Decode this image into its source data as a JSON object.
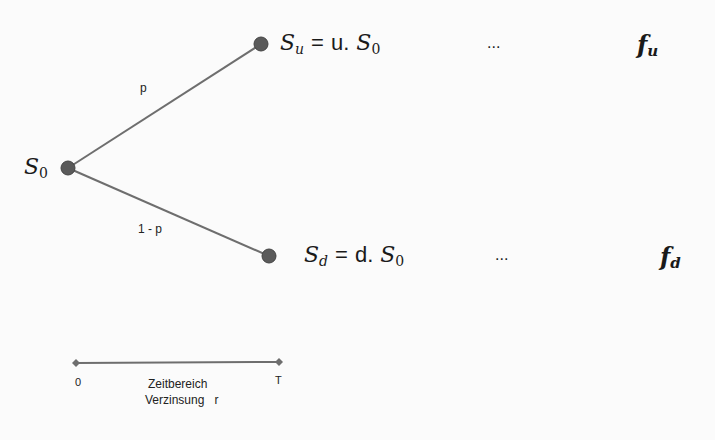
{
  "diagram": {
    "type": "binomial-tree",
    "root": {
      "label_base": "S",
      "label_sub": "0"
    },
    "up_branch": {
      "probability": "p",
      "node": {
        "label_base": "S",
        "label_sub": "u",
        "eq": "=",
        "factor": "u.",
        "rhs_base": "S",
        "rhs_sub": "0"
      },
      "ellipsis": "...",
      "payoff": {
        "base": "f",
        "sub": "u"
      }
    },
    "down_branch": {
      "probability": "1 - p",
      "node": {
        "label_base": "S",
        "label_sub": "d",
        "eq": "=",
        "factor": "d.",
        "rhs_base": "S",
        "rhs_sub": "0"
      },
      "ellipsis": "...",
      "payoff": {
        "base": "f",
        "sub": "d"
      }
    },
    "timeline": {
      "start": "0",
      "end": "T",
      "label_line1": "Zeitbereich",
      "label_line2": "Verzinsung   r"
    },
    "colors": {
      "line": "#6e6e6e",
      "node": "#5a5a5a",
      "text": "#1a1a1a"
    }
  }
}
